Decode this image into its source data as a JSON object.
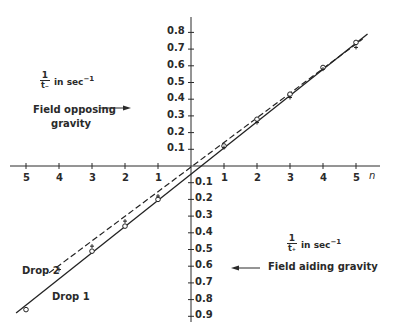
{
  "chart_data": {
    "type": "line",
    "title": "",
    "xlabel": "n",
    "ylabel_upper": "1/t_- in sec^-1",
    "ylabel_lower": "1/t_+ in sec^-1",
    "x_ticks_left": [
      "5",
      "4",
      "3",
      "2",
      "1"
    ],
    "x_ticks_right": [
      "1",
      "2",
      "3",
      "4",
      "5"
    ],
    "y_ticks_upper": [
      "0.8",
      "0.7",
      "0.6",
      "0.5",
      "0.4",
      "0.3",
      "0.2",
      "0.1"
    ],
    "y_ticks_lower": [
      "0.1",
      "0.2",
      "0.3",
      "0.4",
      "0.5",
      "0.6",
      "0.7",
      "0.8",
      "0.9"
    ],
    "xlim": [
      -5.5,
      5.5
    ],
    "ylim": [
      -0.9,
      0.85
    ],
    "grid": false,
    "annotations": [
      {
        "text": "Field opposing gravity",
        "arrow": "right",
        "region": "upper"
      },
      {
        "text": "Field aiding gravity",
        "arrow": "left",
        "region": "lower"
      }
    ],
    "series": [
      {
        "name": "Drop 1",
        "style": "solid",
        "marker": "circle",
        "x": [
          -5,
          -3,
          -2,
          -1,
          1,
          2,
          3,
          4,
          5
        ],
        "y": [
          -0.86,
          -0.51,
          -0.36,
          -0.2,
          0.12,
          0.28,
          0.43,
          0.59,
          0.74
        ]
      },
      {
        "name": "Drop 2",
        "style": "dashed",
        "marker": "cross",
        "x": [
          -4,
          -3,
          -2,
          -1,
          1,
          2,
          3,
          4,
          5
        ],
        "y": [
          -0.62,
          -0.48,
          -0.33,
          -0.18,
          0.11,
          0.26,
          0.41,
          0.58,
          0.71
        ]
      }
    ]
  },
  "labels": {
    "n_axis": "n",
    "upper_frac_num": "1",
    "upper_frac_den": "t₋",
    "upper_unit": "in sec",
    "upper_exp": "−1",
    "lower_frac_num": "1",
    "lower_frac_den": "t₊",
    "lower_unit": "in sec",
    "lower_exp": "−1",
    "opposing_1": "Field opposing",
    "opposing_2": "gravity",
    "aiding": "Field aiding gravity",
    "drop1": "Drop 1",
    "drop2": "Drop 2"
  }
}
